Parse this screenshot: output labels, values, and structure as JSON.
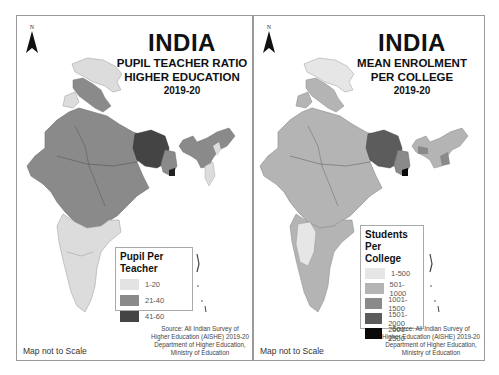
{
  "maps": [
    {
      "id": "ptr",
      "north_label": "N",
      "title": "INDIA",
      "subtitle_1": "PUPIL TEACHER RATIO",
      "subtitle_2": "HIGHER EDUCATION",
      "year": "2019-20",
      "legend": {
        "title": "Pupil Per Teacher",
        "items": [
          {
            "label": "1-20",
            "color": "#e3e3e3"
          },
          {
            "label": "21-40",
            "color": "#8a8a8a"
          },
          {
            "label": "41-60",
            "color": "#444444"
          }
        ]
      },
      "source_lines": [
        "Source: All Indian Survey of",
        "Higher Education (AISHE) 2019-20",
        "Department of Higher Education,",
        "Ministry of Education"
      ],
      "scale_note": "Map not to Scale"
    },
    {
      "id": "enrolment",
      "north_label": "N",
      "title": "INDIA",
      "subtitle_1": "MEAN ENROLMENT",
      "subtitle_2": "PER COLLEGE",
      "year": "2019-20",
      "legend": {
        "title": "Students Per College",
        "title_line1": "Students Per",
        "title_line2": "College",
        "items": [
          {
            "label": "1-500",
            "color": "#e6e6e6"
          },
          {
            "label": "501-1000",
            "color": "#b4b4b4"
          },
          {
            "label": "1001-1500",
            "color": "#8a8a8a"
          },
          {
            "label": "1501-2000",
            "color": "#5c5c5c"
          },
          {
            "label": "2001-2500",
            "color": "#0a0a0a"
          }
        ]
      },
      "source_lines": [
        "Source: All Indian Survey of",
        "Higher Education (AISHE) 2019-20",
        "Department of Higher Education,",
        "Ministry of Education"
      ],
      "scale_note": "Map not to Scale"
    }
  ]
}
